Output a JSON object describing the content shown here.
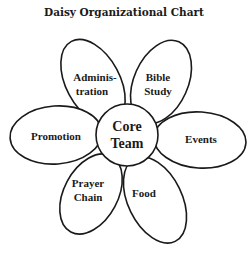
{
  "title": "Daisy Organizational Chart",
  "center": {
    "line1": "Core",
    "line2": "Team"
  },
  "petals": [
    {
      "id": "administration",
      "line1": "Adminis-",
      "line2": "tration"
    },
    {
      "id": "bible-study",
      "line1": "Bible",
      "line2": "Study"
    },
    {
      "id": "promotion",
      "line1": "Promotion",
      "line2": ""
    },
    {
      "id": "events",
      "line1": "Events",
      "line2": ""
    },
    {
      "id": "prayer-chain",
      "line1": "Prayer",
      "line2": "Chain"
    },
    {
      "id": "food",
      "line1": "Food",
      "line2": ""
    }
  ],
  "colors": {
    "stroke": "#1a1a1a",
    "fill": "#ffffff",
    "background": "#ffffff"
  }
}
